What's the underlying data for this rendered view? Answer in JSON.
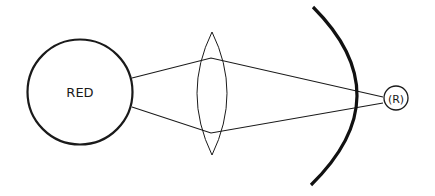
{
  "diagram": {
    "source": {
      "label": "RED",
      "shape": "circle"
    },
    "lens": {
      "shape": "biconvex-lens"
    },
    "mirror": {
      "shape": "curved-arc"
    },
    "target": {
      "label": "(R)",
      "shape": "small-circle"
    },
    "rays": [
      {
        "name": "upper-ray"
      },
      {
        "name": "lower-ray"
      }
    ],
    "colors": {
      "stroke": "#1a1a1a",
      "background": "#ffffff"
    }
  }
}
